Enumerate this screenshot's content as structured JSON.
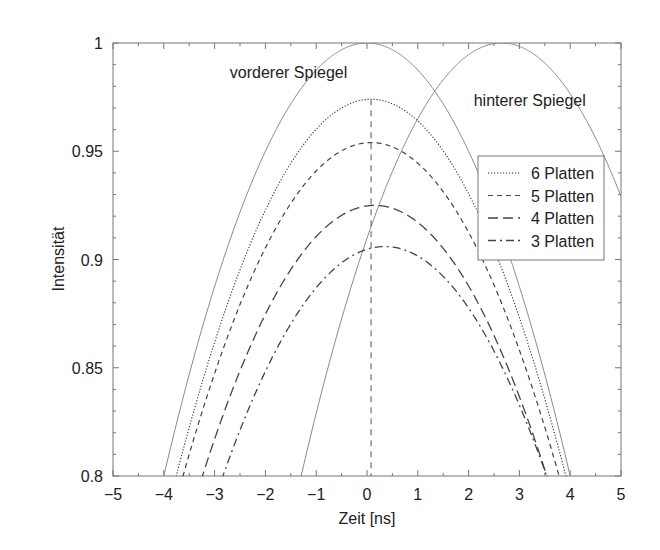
{
  "chart_data": {
    "type": "line",
    "title": "",
    "xlabel": "Zeit [ns]",
    "ylabel": "Intensität",
    "xlim": [
      -5,
      5
    ],
    "ylim": [
      0.8,
      1.0
    ],
    "grid": false,
    "x_ticks": [
      -5,
      -4,
      -3,
      -2,
      -1,
      0,
      1,
      2,
      3,
      4,
      5
    ],
    "x_tick_labels": [
      "−5",
      "−4",
      "−3",
      "−2",
      "−1",
      "0",
      "1",
      "2",
      "3",
      "4",
      "5"
    ],
    "y_ticks": [
      0.8,
      0.85,
      0.9,
      0.95,
      1.0
    ],
    "y_tick_labels": [
      "0.8",
      "0.85",
      "0.9",
      "0.95",
      "1"
    ],
    "legend": {
      "position": "upper right (inside)",
      "entries": [
        "6 Platten",
        "5 Platten",
        "4 Platten",
        "3 Platten"
      ]
    },
    "annotations": [
      {
        "text": "vorderer Spiegel",
        "x": -2.7,
        "y": 0.984
      },
      {
        "text": "hinterer Spiegel",
        "x": 2.1,
        "y": 0.971
      }
    ],
    "vertical_line": {
      "x": 0.08,
      "style": "dashed",
      "from": 0.8,
      "to": 0.974
    },
    "series": [
      {
        "name": "vorderer Spiegel",
        "style": "solid",
        "peak_t": 0.0,
        "peak_I": 1.0,
        "k": 0.0125,
        "x": [
          -4,
          -3,
          -2,
          -1,
          0,
          1,
          2,
          3,
          4
        ],
        "values": [
          0.8,
          0.888,
          0.95,
          0.988,
          1.0,
          0.988,
          0.95,
          0.888,
          0.8
        ]
      },
      {
        "name": "hinterer Spiegel",
        "style": "solid",
        "peak_t": 2.65,
        "peak_I": 1.0,
        "k": 0.01284,
        "x": [
          -1.36,
          -1,
          0,
          1,
          2,
          2.65,
          3,
          4,
          5
        ],
        "values": [
          0.8,
          0.829,
          0.91,
          0.965,
          0.995,
          1.0,
          0.998,
          0.977,
          0.929
        ]
      },
      {
        "name": "6 Platten",
        "style": "dotted",
        "peak_t": 0.08,
        "peak_I": 0.974,
        "k": 0.01183,
        "x": [
          -3.76,
          -3,
          -2,
          -1,
          0,
          1,
          2,
          3,
          3.84
        ],
        "values": [
          0.8,
          0.862,
          0.923,
          0.96,
          0.974,
          0.964,
          0.93,
          0.873,
          0.8
        ]
      },
      {
        "name": "5 Platten",
        "style": "dashed",
        "peak_t": 0.08,
        "peak_I": 0.954,
        "k": 0.01124,
        "x": [
          -3.63,
          -3,
          -2,
          -1,
          0,
          1,
          2,
          3,
          3.79
        ],
        "values": [
          0.8,
          0.847,
          0.905,
          0.941,
          0.954,
          0.944,
          0.913,
          0.858,
          0.8
        ]
      },
      {
        "name": "4 Platten",
        "style": "long-dashed",
        "peak_t": 0.15,
        "peak_I": 0.925,
        "k": 0.01088,
        "x": [
          -3.24,
          -3,
          -2,
          -1,
          0,
          1,
          2,
          3,
          3.54
        ],
        "values": [
          0.8,
          0.817,
          0.875,
          0.911,
          0.925,
          0.917,
          0.888,
          0.837,
          0.8
        ]
      },
      {
        "name": "3 Platten",
        "style": "dash-dot",
        "peak_t": 0.35,
        "peak_I": 0.906,
        "k": 0.01044,
        "x": [
          -2.84,
          -2,
          -1,
          0,
          1,
          2,
          3,
          3.54
        ],
        "values": [
          0.8,
          0.848,
          0.887,
          0.905,
          0.902,
          0.878,
          0.833,
          0.8
        ]
      }
    ]
  }
}
